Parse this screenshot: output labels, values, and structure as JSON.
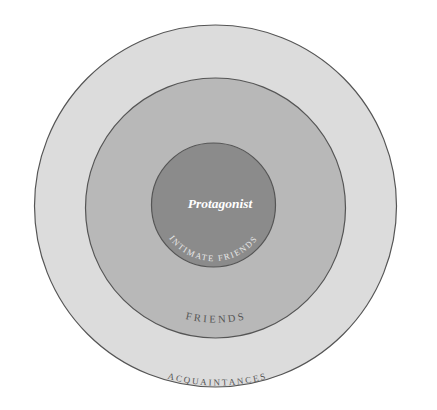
{
  "diagram": {
    "type": "concentric-circles",
    "colors": {
      "background": "#ffffff",
      "outer_fill": "#dcdcdc",
      "middle_fill": "#b8b8b8",
      "inner_fill": "#8b8b8b",
      "stroke": "#555555",
      "inner_text": "#ffffff",
      "ring_text": "#555555",
      "inner_ring_text": "#e8e8e8"
    },
    "rings": [
      {
        "id": "outer",
        "label": "ACQUAINTANCES"
      },
      {
        "id": "middle",
        "label": "FRIENDS"
      },
      {
        "id": "inner",
        "label": "INTIMATE FRIENDS"
      }
    ],
    "center": {
      "label": "Protagonist"
    }
  }
}
